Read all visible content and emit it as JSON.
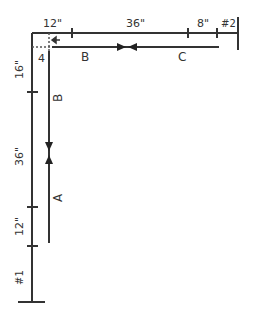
{
  "diagram": {
    "top_dimensions": {
      "seg1": "12\"",
      "seg2": "36\"",
      "seg3": "8\"",
      "end_label": "#2"
    },
    "left_dimensions": {
      "seg1": "16\"",
      "seg2": "36\"",
      "seg3": "12\"",
      "end_label": "#1"
    },
    "corner_label": "4",
    "vectors": {
      "top_left": "B",
      "top_right": "C",
      "left_upper": "B",
      "left_lower": "A"
    },
    "line_color": "#333333"
  }
}
